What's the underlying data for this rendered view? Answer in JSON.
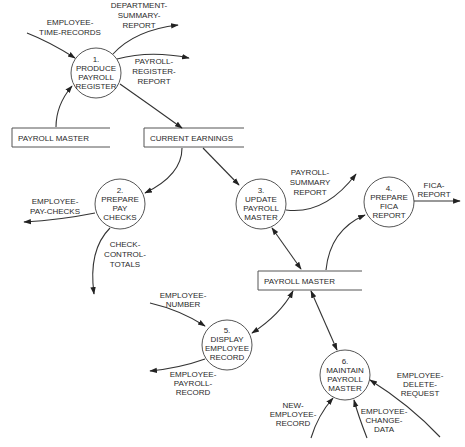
{
  "diagram": {
    "type": "data-flow-diagram",
    "processes": [
      {
        "id": "1",
        "lines": [
          "1.",
          "PRODUCE",
          "PAYROLL",
          "REGISTER"
        ]
      },
      {
        "id": "2",
        "lines": [
          "2.",
          "PREPARE",
          "PAY",
          "CHECKS"
        ]
      },
      {
        "id": "3",
        "lines": [
          "3.",
          "UPDATE",
          "PAYROLL",
          "MASTER"
        ]
      },
      {
        "id": "4",
        "lines": [
          "4.",
          "PREPARE",
          "FICA",
          "REPORT"
        ]
      },
      {
        "id": "5",
        "lines": [
          "5.",
          "DISPLAY",
          "EMPLOYEE",
          "RECORD"
        ]
      },
      {
        "id": "6",
        "lines": [
          "6.",
          "MAINTAIN",
          "PAYROLL",
          "MASTER"
        ]
      }
    ],
    "stores": [
      {
        "id": "pm1",
        "label": "PAYROLL MASTER"
      },
      {
        "id": "ce",
        "label": "CURRENT EARNINGS"
      },
      {
        "id": "pm2",
        "label": "PAYROLL MASTER"
      }
    ],
    "flows": [
      {
        "id": "f1",
        "lines": [
          "EMPLOYEE-",
          "TIME-RECORDS"
        ],
        "from": "external",
        "to": "1"
      },
      {
        "id": "f2",
        "lines": [
          "DEPARTMENT-",
          "SUMMARY-",
          "REPORT"
        ],
        "from": "1",
        "to": "external"
      },
      {
        "id": "f3",
        "lines": [
          "PAYROLL-",
          "REGISTER-",
          "REPORT"
        ],
        "from": "1",
        "to": "external"
      },
      {
        "id": "f4",
        "lines": [],
        "from": "pm1",
        "to": "1"
      },
      {
        "id": "f5",
        "lines": [],
        "from": "1",
        "to": "ce"
      },
      {
        "id": "f6",
        "lines": [],
        "from": "ce",
        "to": "2"
      },
      {
        "id": "f7",
        "lines": [],
        "from": "ce",
        "to": "3"
      },
      {
        "id": "f8",
        "lines": [
          "EMPLOYEE-",
          "PAY-CHECKS"
        ],
        "from": "2",
        "to": "external"
      },
      {
        "id": "f9",
        "lines": [
          "CHECK-",
          "CONTROL-",
          "TOTALS"
        ],
        "from": "2",
        "to": "external"
      },
      {
        "id": "f10",
        "lines": [
          "PAYROLL-",
          "SUMMARY",
          "REPORT"
        ],
        "from": "3",
        "to": "external"
      },
      {
        "id": "f11",
        "lines": [
          "FICA-",
          "REPORT"
        ],
        "from": "4",
        "to": "external"
      },
      {
        "id": "f12",
        "lines": [],
        "from": "pm2",
        "to": "4"
      },
      {
        "id": "f13",
        "lines": [],
        "from": "3",
        "to": "pm2",
        "bidirectional": true
      },
      {
        "id": "f14",
        "lines": [
          "EMPLOYEE-",
          "NUMBER"
        ],
        "from": "external",
        "to": "5"
      },
      {
        "id": "f15",
        "lines": [
          "EMPLOYEE-",
          "PAYROLL-",
          "RECORD"
        ],
        "from": "5",
        "to": "external"
      },
      {
        "id": "f16",
        "lines": [],
        "from": "5",
        "to": "pm2",
        "bidirectional": true
      },
      {
        "id": "f17",
        "lines": [],
        "from": "6",
        "to": "pm2",
        "bidirectional": true
      },
      {
        "id": "f18",
        "lines": [
          "NEW-",
          "EMPLOYEE-",
          "RECORD"
        ],
        "from": "external",
        "to": "6"
      },
      {
        "id": "f19",
        "lines": [
          "EMPLOYEE-",
          "CHANGE-",
          "DATA"
        ],
        "from": "external",
        "to": "6"
      },
      {
        "id": "f20",
        "lines": [
          "EMPLOYEE-",
          "DELETE-",
          "REQUEST"
        ],
        "from": "external",
        "to": "6"
      }
    ]
  }
}
